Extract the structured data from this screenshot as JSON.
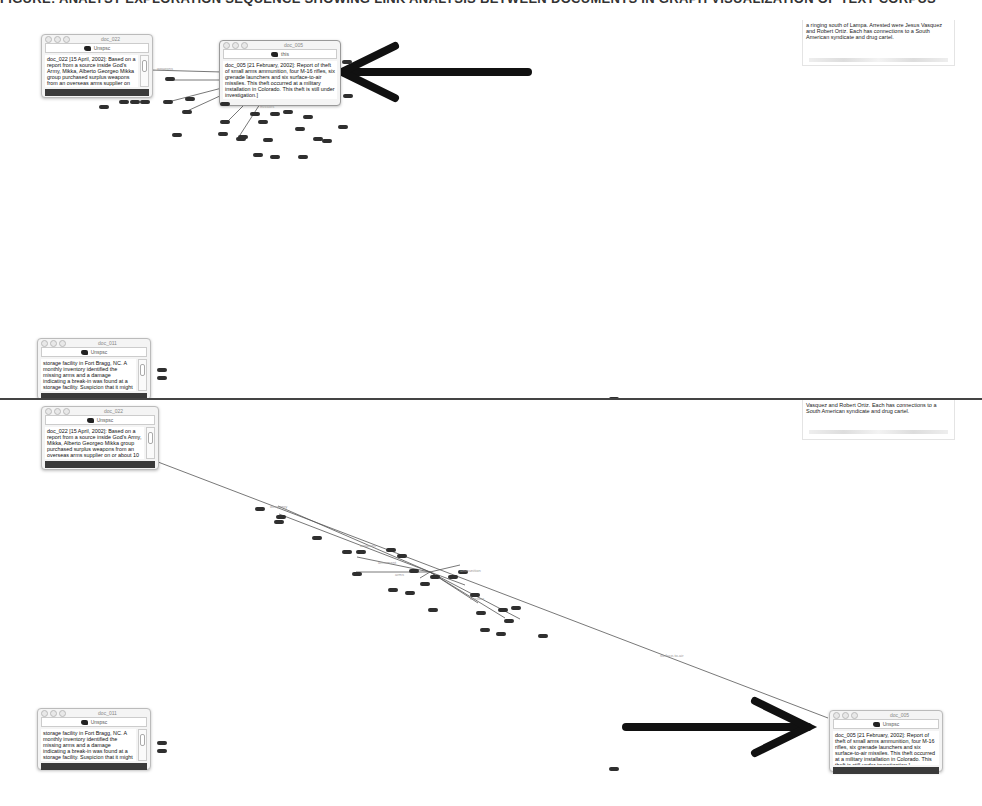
{
  "top_strip": {
    "text": "FIGURE: ANALYST EXPLORATION SEQUENCE SHOWING LINK ANALYSIS BETWEEN DOCUMENTS IN GRAPH VISUALIZATION OF TEXT CORPUS"
  },
  "panels": [
    {
      "id": "before",
      "windows": [
        {
          "id": "doc_022_top",
          "title": "doc_022",
          "toolbar_label": "Unspsc",
          "text": "doc_022 [15 April, 2002]: Based on a report from a source inside God's Army, Mikka, Alberto Georgeo Mikka group purchased surplus weapons from an overseas arms supplier on or about 10 April, 2002. Purchase believed to include automatic weapons of various",
          "underlined": [
            "God's Army",
            "Mikka",
            "Alberto",
            "Georgeo",
            "weapons"
          ]
        },
        {
          "id": "doc_005_top",
          "title": "doc_005",
          "toolbar_label": "this",
          "text": "doc_005 [21 February, 2002]: Report of theft of small arms ammunition, four M-16 rifles, six grenade launchers and six surface-to-air missiles. This theft occurred at a military installation in Colorado. This theft is still under investigation.]",
          "underlined": [
            "missiles",
            "Colorado"
          ]
        },
        {
          "id": "doc_storage_top",
          "title": "doc_011",
          "toolbar_label": "Unspsc",
          "text": "storage facility in Fort Bragg, NC. A monthly inventory identified the missing arms and a damage indicating a break-in was found at a storage facility. Suspicion that it might be an inside job because of the lack of further external evidence.",
          "underlined": [
            "Fort Bragg",
            "NC"
          ]
        }
      ],
      "fragment": {
        "text": "a ringing south of Lampa. Arrested were Jesus Vasquez and Robert Ortiz. Each has connections to a South American syndicate and drug cartel."
      },
      "arrow": {
        "direction": "left",
        "points_to": "doc_005"
      },
      "edge_labels": [
        "weapons",
        "missiles"
      ]
    },
    {
      "id": "after",
      "windows": [
        {
          "id": "doc_022_bottom",
          "title": "doc_022",
          "toolbar_label": "Unspsc",
          "text": "doc_022 [15 April, 2002]: Based on a report from a source inside God's Army, Mikka, Alberto Georgeo Mikka group purchased surplus weapons from an overseas arms supplier on or about 10 April, 2002. Purchase believed to include automatic weapons of various",
          "underlined": [
            "God's Army",
            "Mikka",
            "Alberto",
            "Georgeo",
            "weapons"
          ]
        },
        {
          "id": "doc_005_bottom",
          "title": "doc_005",
          "toolbar_label": "Unspsc",
          "text": "doc_005 [21 February, 2002]: Report of theft of small arms ammunition, four M-16 rifles, six grenade launchers and six surface-to-air missiles. This theft occurred at a military installation in Colorado. This theft is still under investigation.]",
          "underlined": [
            "missiles",
            "Colorado"
          ]
        },
        {
          "id": "doc_storage_bottom",
          "title": "doc_011",
          "toolbar_label": "Unspsc",
          "text": "storage facility in Fort Bragg, NC. A monthly inventory identified the missing arms and a damage indicating a break-in was found at a storage facility. Suspicion that it might be an inside job because of the lack of further external evidence.",
          "underlined": [
            "Fort Bragg",
            "NC"
          ]
        }
      ],
      "fragment": {
        "text": "Vasquez and Robert Ortiz. Each has connections to a South American syndicate and drug cartel."
      },
      "arrow": {
        "direction": "right",
        "points_to": "doc_005"
      },
      "edge_labels": [
        "weaponry",
        "weapons",
        "armament",
        "arms",
        "ammunition",
        "missiles",
        "surface-to-air"
      ]
    }
  ],
  "colors": {
    "background": "#ffffff",
    "node": "#2f2f2f",
    "edge": "#555555",
    "arrow": "#111111",
    "window_footer": "#3a3a3a"
  }
}
